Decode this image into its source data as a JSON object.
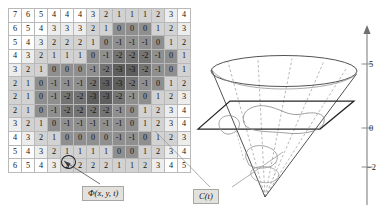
{
  "figure": {
    "panels": [
      "level-set-grid",
      "cone-3d-plot"
    ]
  },
  "grid": {
    "rows": 12,
    "cols": 14,
    "values": [
      [
        7,
        6,
        5,
        4,
        4,
        4,
        3,
        2,
        1,
        1,
        1,
        2,
        3,
        4
      ],
      [
        6,
        5,
        4,
        3,
        3,
        3,
        2,
        1,
        0,
        0,
        0,
        1,
        2,
        3
      ],
      [
        5,
        4,
        3,
        2,
        2,
        2,
        1,
        0,
        -1,
        -1,
        -1,
        0,
        1,
        2
      ],
      [
        4,
        3,
        2,
        1,
        1,
        1,
        0,
        -1,
        -2,
        -2,
        -2,
        -1,
        0,
        1
      ],
      [
        3,
        2,
        1,
        0,
        0,
        0,
        -1,
        -2,
        -3,
        -3,
        -2,
        -1,
        0,
        1
      ],
      [
        2,
        1,
        0,
        -1,
        -1,
        -1,
        -2,
        -3,
        -3,
        -2,
        -1,
        0,
        1,
        2
      ],
      [
        2,
        1,
        0,
        -1,
        -2,
        -2,
        -3,
        -3,
        -2,
        -1,
        0,
        1,
        2,
        3
      ],
      [
        2,
        1,
        0,
        -1,
        -2,
        -2,
        -2,
        -2,
        -1,
        0,
        1,
        2,
        3,
        4
      ],
      [
        3,
        2,
        1,
        0,
        -1,
        -1,
        -1,
        -1,
        -1,
        0,
        1,
        2,
        3,
        4
      ],
      [
        4,
        3,
        2,
        1,
        0,
        0,
        0,
        0,
        -1,
        -1,
        0,
        1,
        2,
        3
      ],
      [
        5,
        4,
        3,
        2,
        1,
        1,
        1,
        1,
        0,
        0,
        1,
        2,
        3,
        4
      ],
      [
        6,
        5,
        4,
        3,
        2,
        2,
        2,
        2,
        1,
        1,
        2,
        3,
        4,
        5
      ]
    ],
    "highlighted_cell": {
      "row": 10,
      "col": 3,
      "value": 2,
      "marker": "circle"
    }
  },
  "callouts": {
    "phi_grid_label": "Φ(x, y, t)",
    "curve_label": "C(t)"
  },
  "plot3d": {
    "axis_label": "Φ(x, y, t)",
    "tick_labels": [
      "5",
      "0",
      "−2"
    ],
    "shapes": [
      "cone-surface",
      "zero-level-plane",
      "level-curve"
    ]
  },
  "colors": {
    "grid_line": "#b9b9b9",
    "callout_bg": "#e3e1dd",
    "ink": "#141414",
    "shade_0": "#ffffff",
    "shade_1": "#ededed",
    "shade_2": "#d2d2d2",
    "shade_3": "#b4b4b4",
    "shade_4": "#8f8f8f",
    "shade_5": "#747474",
    "shade_6": "#5e5e5e"
  }
}
